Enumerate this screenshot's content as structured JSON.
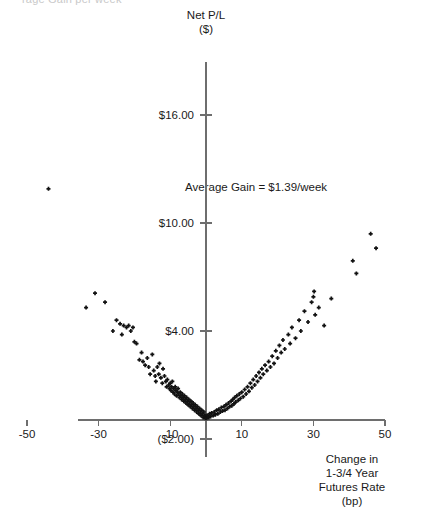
{
  "clipped_header_text": "rage Gain per week",
  "axes": {
    "y_title_line1": "Net P/L",
    "y_title_line2": "($)",
    "x_title_line1": "Change in",
    "x_title_line2": "1-3/4 Year",
    "x_title_line3": "Futures Rate",
    "x_title_line4": "(bp)",
    "y_ticks": [
      "$16.00",
      "$10.00",
      "$4.00",
      "($2.00)"
    ],
    "x_ticks": [
      "-50",
      "-30",
      "-10",
      "10",
      "30",
      "50"
    ]
  },
  "annotation": {
    "average_gain": "Average Gain = $1.39/week"
  },
  "colors": {
    "marker": "#121212",
    "axis": "#6e6e6e",
    "text": "#1a1a1a"
  },
  "chart_data": {
    "type": "scatter",
    "title": "",
    "xlabel": "Change in 1-3/4 Year Futures Rate (bp)",
    "ylabel": "Net P/L ($)",
    "xlim": [
      -50,
      50
    ],
    "ylim": [
      -2,
      19
    ],
    "grid": false,
    "legend": null,
    "y_tick_values": [
      16,
      10,
      4,
      -2
    ],
    "x_tick_values": [
      -50,
      -30,
      -10,
      10,
      30,
      50
    ],
    "annotations": [
      {
        "text": "Average Gain = $1.39/week",
        "x": 14,
        "y": 12.0
      }
    ],
    "series": [
      {
        "name": "Net P/L vs rate change",
        "points": [
          [
            -44.0,
            11.9
          ],
          [
            -33.5,
            5.3
          ],
          [
            -31.0,
            6.1
          ],
          [
            -28.2,
            5.6
          ],
          [
            -26.0,
            4.0
          ],
          [
            -25.0,
            4.6
          ],
          [
            -24.0,
            4.4
          ],
          [
            -23.5,
            3.8
          ],
          [
            -23.0,
            4.3
          ],
          [
            -22.2,
            4.2
          ],
          [
            -21.6,
            4.3
          ],
          [
            -21.0,
            4.0
          ],
          [
            -20.4,
            4.2
          ],
          [
            -20.0,
            3.4
          ],
          [
            -19.4,
            3.3
          ],
          [
            -18.6,
            2.4
          ],
          [
            -18.0,
            2.8
          ],
          [
            -17.6,
            2.3
          ],
          [
            -17.0,
            2.1
          ],
          [
            -16.4,
            2.5
          ],
          [
            -16.0,
            2.0
          ],
          [
            -15.6,
            1.6
          ],
          [
            -15.0,
            2.7
          ],
          [
            -14.6,
            1.8
          ],
          [
            -14.2,
            1.5
          ],
          [
            -14.0,
            1.2
          ],
          [
            -13.6,
            2.0
          ],
          [
            -13.2,
            1.6
          ],
          [
            -13.0,
            2.2
          ],
          [
            -12.6,
            1.4
          ],
          [
            -12.2,
            1.1
          ],
          [
            -12.0,
            1.9
          ],
          [
            -11.6,
            1.5
          ],
          [
            -11.2,
            1.2
          ],
          [
            -11.0,
            0.9
          ],
          [
            -10.8,
            1.3
          ],
          [
            -10.4,
            1.0
          ],
          [
            -10.2,
            0.8
          ],
          [
            -10.0,
            1.1
          ],
          [
            -9.8,
            0.7
          ],
          [
            -9.6,
            0.9
          ],
          [
            -9.4,
            1.2
          ],
          [
            -9.2,
            0.6
          ],
          [
            -9.0,
            0.8
          ],
          [
            -8.8,
            0.5
          ],
          [
            -8.6,
            0.9
          ],
          [
            -8.4,
            0.7
          ],
          [
            -8.2,
            0.4
          ],
          [
            -8.0,
            0.6
          ],
          [
            -7.8,
            0.8
          ],
          [
            -7.6,
            0.5
          ],
          [
            -7.4,
            0.3
          ],
          [
            -7.2,
            0.6
          ],
          [
            -7.0,
            0.4
          ],
          [
            -6.8,
            0.2
          ],
          [
            -6.6,
            0.5
          ],
          [
            -6.4,
            0.3
          ],
          [
            -6.2,
            0.1
          ],
          [
            -6.0,
            0.4
          ],
          [
            -5.8,
            0.2
          ],
          [
            -5.6,
            0.0
          ],
          [
            -5.4,
            0.3
          ],
          [
            -5.2,
            0.1
          ],
          [
            -5.0,
            -0.1
          ],
          [
            -4.8,
            0.2
          ],
          [
            -4.6,
            0.0
          ],
          [
            -4.4,
            -0.2
          ],
          [
            -4.2,
            0.1
          ],
          [
            -4.0,
            -0.1
          ],
          [
            -3.8,
            -0.3
          ],
          [
            -3.6,
            0.0
          ],
          [
            -3.4,
            -0.2
          ],
          [
            -3.2,
            -0.4
          ],
          [
            -3.0,
            -0.1
          ],
          [
            -2.8,
            -0.3
          ],
          [
            -2.6,
            -0.5
          ],
          [
            -2.4,
            -0.2
          ],
          [
            -2.2,
            -0.4
          ],
          [
            -2.0,
            -0.6
          ],
          [
            -1.8,
            -0.3
          ],
          [
            -1.6,
            -0.5
          ],
          [
            -1.4,
            -0.7
          ],
          [
            -1.2,
            -0.4
          ],
          [
            -1.0,
            -0.6
          ],
          [
            -0.8,
            -0.8
          ],
          [
            -0.6,
            -0.5
          ],
          [
            -0.4,
            -0.7
          ],
          [
            -0.2,
            -0.85
          ],
          [
            0.0,
            -0.7
          ],
          [
            0.2,
            -0.85
          ],
          [
            0.5,
            -0.7
          ],
          [
            0.8,
            -0.8
          ],
          [
            1.0,
            -0.6
          ],
          [
            1.3,
            -0.75
          ],
          [
            1.6,
            -0.55
          ],
          [
            2.0,
            -0.7
          ],
          [
            2.3,
            -0.5
          ],
          [
            2.6,
            -0.65
          ],
          [
            3.0,
            -0.4
          ],
          [
            3.3,
            -0.6
          ],
          [
            3.6,
            -0.35
          ],
          [
            4.0,
            -0.5
          ],
          [
            4.3,
            -0.25
          ],
          [
            4.6,
            -0.45
          ],
          [
            5.0,
            -0.2
          ],
          [
            5.3,
            -0.4
          ],
          [
            5.6,
            -0.1
          ],
          [
            6.0,
            -0.3
          ],
          [
            6.3,
            0.0
          ],
          [
            6.6,
            -0.2
          ],
          [
            7.0,
            0.1
          ],
          [
            7.2,
            -0.15
          ],
          [
            7.5,
            0.2
          ],
          [
            7.8,
            -0.05
          ],
          [
            8.0,
            0.3
          ],
          [
            8.3,
            0.05
          ],
          [
            8.6,
            0.4
          ],
          [
            9.0,
            0.15
          ],
          [
            9.3,
            0.5
          ],
          [
            9.6,
            0.25
          ],
          [
            10.0,
            0.6
          ],
          [
            10.4,
            0.35
          ],
          [
            10.8,
            0.75
          ],
          [
            11.2,
            0.5
          ],
          [
            11.6,
            0.9
          ],
          [
            12.0,
            0.65
          ],
          [
            12.4,
            1.1
          ],
          [
            12.8,
            0.85
          ],
          [
            13.2,
            1.3
          ],
          [
            13.6,
            1.0
          ],
          [
            14.0,
            1.5
          ],
          [
            14.4,
            1.2
          ],
          [
            14.8,
            1.7
          ],
          [
            15.2,
            1.4
          ],
          [
            15.6,
            1.9
          ],
          [
            16.0,
            1.6
          ],
          [
            16.5,
            2.1
          ],
          [
            17.0,
            1.8
          ],
          [
            17.5,
            2.3
          ],
          [
            18.0,
            2.0
          ],
          [
            18.5,
            2.6
          ],
          [
            19.0,
            2.2
          ],
          [
            19.5,
            2.9
          ],
          [
            20.0,
            2.5
          ],
          [
            20.5,
            3.2
          ],
          [
            21.0,
            2.8
          ],
          [
            21.5,
            3.5
          ],
          [
            22.0,
            3.0
          ],
          [
            23.0,
            3.8
          ],
          [
            23.5,
            3.3
          ],
          [
            24.0,
            4.2
          ],
          [
            25.0,
            3.6
          ],
          [
            26.0,
            4.6
          ],
          [
            26.5,
            4.0
          ],
          [
            27.5,
            5.1
          ],
          [
            28.5,
            4.5
          ],
          [
            29.5,
            5.6
          ],
          [
            30.0,
            5.9
          ],
          [
            30.2,
            6.2
          ],
          [
            30.5,
            4.9
          ],
          [
            31.5,
            5.3
          ],
          [
            33.0,
            4.3
          ],
          [
            35.0,
            5.8
          ],
          [
            41.0,
            7.9
          ],
          [
            42.0,
            7.2
          ],
          [
            46.0,
            9.4
          ],
          [
            47.5,
            8.6
          ]
        ]
      }
    ]
  }
}
